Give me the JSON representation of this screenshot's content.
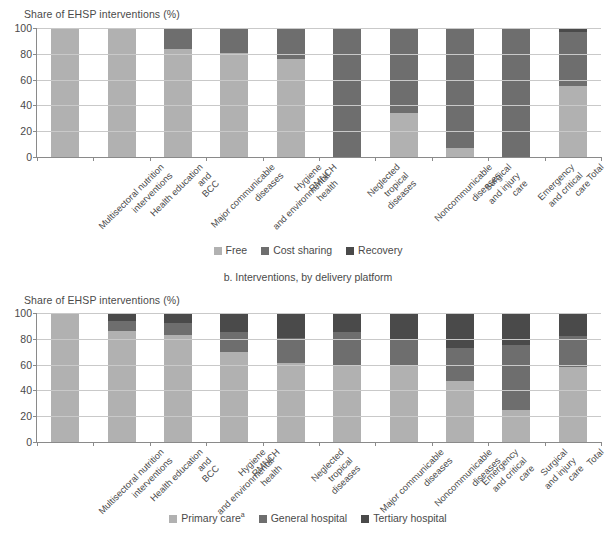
{
  "chart_data": [
    {
      "type": "bar",
      "stacked": true,
      "panel_id": "a",
      "title": "",
      "ylabel": "Share of EHSP interventions (%)",
      "xlabel": "",
      "ylim": [
        0,
        100
      ],
      "yticks": [
        0,
        20,
        40,
        60,
        80,
        100
      ],
      "grid": true,
      "legend_position": "bottom",
      "categories": [
        "Multisectoral nutrition interventions",
        "Health education and BCC",
        "Major communicable diseases",
        "Hygiene and environmental health",
        "RMNCH",
        "Neglected tropical diseases",
        "Noncommunicable diseases",
        "Surgical and injury care",
        "Emergency and critical care",
        "Total"
      ],
      "series": [
        {
          "name": "Free",
          "color": "#b1b1b1",
          "values": [
            100,
            100,
            84,
            81,
            76,
            0,
            34,
            7,
            0,
            55
          ]
        },
        {
          "name": "Cost sharing",
          "color": "#6e6e6e",
          "values": [
            0,
            0,
            16,
            19,
            24,
            100,
            66,
            93,
            100,
            42
          ]
        },
        {
          "name": "Recovery",
          "color": "#4a4a4a",
          "values": [
            0,
            0,
            0,
            0,
            0,
            0,
            0,
            0,
            0,
            3
          ]
        }
      ]
    },
    {
      "type": "bar",
      "stacked": true,
      "panel_id": "b",
      "title": "b. Interventions, by delivery platform",
      "ylabel": "Share of EHSP interventions (%)",
      "xlabel": "",
      "ylim": [
        0,
        100
      ],
      "yticks": [
        0,
        20,
        40,
        60,
        80,
        100
      ],
      "grid": true,
      "legend_position": "bottom",
      "categories": [
        "Multisectoral nutrition interventions",
        "Health education and BCC",
        "Hygiene and environmental health",
        "RMNCH",
        "Neglected tropical diseases",
        "Major communicable diseases",
        "Noncommunicable diseases",
        "Emergency and critical care",
        "Surgical and injury care",
        "Total"
      ],
      "series": [
        {
          "name": "Primary care",
          "color": "#b1b1b1",
          "values": [
            100,
            86,
            83,
            70,
            61,
            60,
            60,
            47,
            25,
            58
          ]
        },
        {
          "name": "General hospital",
          "color": "#6e6e6e",
          "values": [
            0,
            8,
            9,
            15,
            20,
            25,
            19,
            26,
            50,
            24
          ]
        },
        {
          "name": "Tertiary hospital",
          "color": "#4a4a4a",
          "values": [
            0,
            6,
            8,
            15,
            19,
            15,
            21,
            27,
            25,
            18
          ]
        }
      ]
    }
  ],
  "panel_a": {
    "ylabel": "Share of EHSP interventions (%)",
    "legend": [
      {
        "label": "Free"
      },
      {
        "label": "Cost sharing"
      },
      {
        "label": "Recovery"
      }
    ]
  },
  "panel_b": {
    "subtitle": "b. Interventions, by delivery platform",
    "ylabel": "Share of EHSP interventions (%)",
    "legend": [
      {
        "label": "Primary care",
        "footnote": "a"
      },
      {
        "label": "General hospital",
        "footnote": ""
      },
      {
        "label": "Tertiary hospital",
        "footnote": ""
      }
    ]
  }
}
